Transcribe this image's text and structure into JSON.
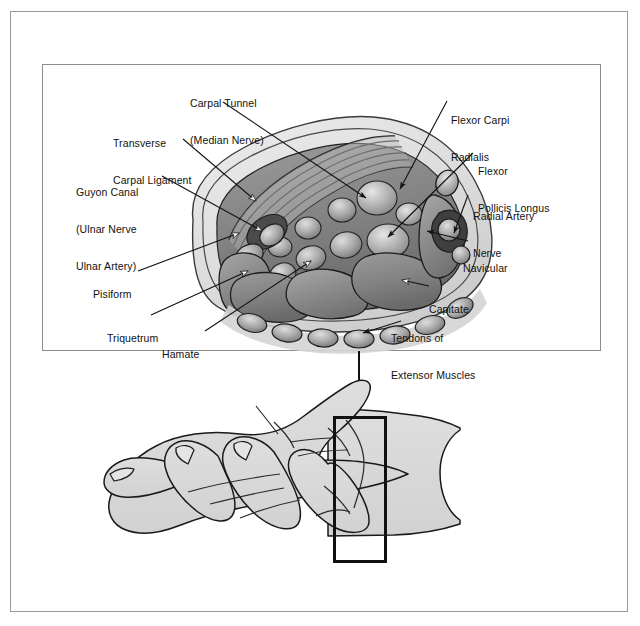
{
  "figure": {
    "style": "grayscale line-and-tone medical illustration"
  },
  "detail_panel": {
    "name": "carpal-tunnel-cross-section",
    "caption": "Transverse cross section through the carpal tunnel"
  },
  "labels": {
    "carpal_tunnel": {
      "line1": "Carpal Tunnel",
      "line2": "(Median Nerve)"
    },
    "transverse_carpal_ligament": {
      "line1": "Transverse",
      "line2": "Carpal Ligament"
    },
    "guyon_canal": {
      "line1": "Guyon Canal",
      "line2": "(Ulnar Nerve",
      "line3": "Ulnar Artery)"
    },
    "pisiform": {
      "line1": "Pisiform"
    },
    "triquetrum": {
      "line1": "Triquetrum"
    },
    "hamate": {
      "line1": "Hamate"
    },
    "flexor_carpi_radialis": {
      "line1": "Flexor Carpi",
      "line2": "Radialis"
    },
    "flexor_pollicis_longus": {
      "line1": "Flexor",
      "line2": "Pollicis Longus"
    },
    "radial_artery_nerve": {
      "line1": "Radial Artery",
      "line2": "Nerve"
    },
    "navicular": {
      "line1": "Navicular"
    },
    "capitate": {
      "line1": "Capitate"
    },
    "tendons_extensor": {
      "line1": "Tendons of",
      "line2": "Extensor Muscles"
    }
  },
  "hand_figure": {
    "name": "palmar-hand-view",
    "roi_label": "",
    "note": "Rectangle marks the cross-section level at the distal wrist"
  },
  "colors": {
    "outer_frame": "#9a9a9a",
    "panel_border": "#8d8d8d",
    "ink": "#111111",
    "skin_fill": "#d8d8d8",
    "bone_mid": "#8f8f8f",
    "bone_dark": "#6d6d6d",
    "tendon_light": "#bdbdbd",
    "sheath_fill": "#cfcfcf",
    "background": "#ffffff"
  }
}
